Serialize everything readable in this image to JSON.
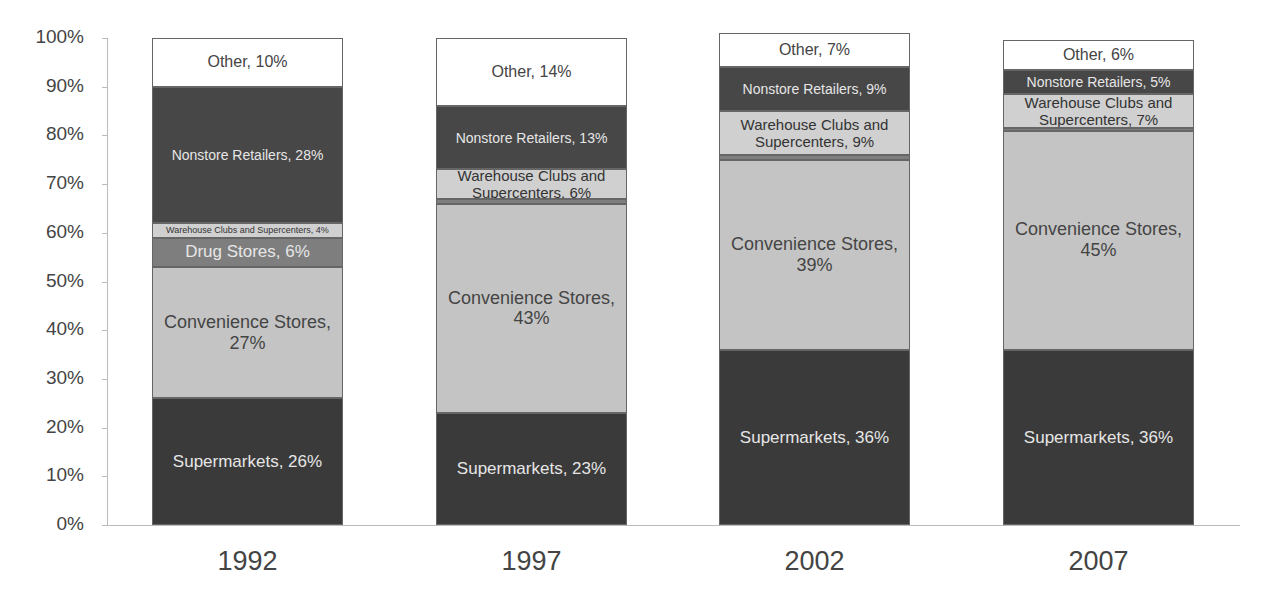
{
  "chart_data": {
    "type": "bar",
    "stacked": true,
    "percent_stacked": true,
    "title": "",
    "xlabel": "",
    "ylabel": "",
    "ylim": [
      0,
      100
    ],
    "yticks": [
      "0%",
      "10%",
      "20%",
      "30%",
      "40%",
      "50%",
      "60%",
      "70%",
      "80%",
      "90%",
      "100%"
    ],
    "categories": [
      "1992",
      "1997",
      "2002",
      "2007"
    ],
    "legend": null,
    "grid": false,
    "series": [
      {
        "name": "Supermarkets",
        "color": "#3a3a3a",
        "text_color": "#e6e6e6",
        "values": [
          26,
          23,
          36,
          36
        ],
        "labels": [
          "Supermarkets, 26%",
          "Supermarkets, 23%",
          "Supermarkets, 36%",
          "Supermarkets, 36%"
        ]
      },
      {
        "name": "Convenience Stores",
        "color": "#c4c4c4",
        "text_color": "#444444",
        "values": [
          27,
          43,
          39,
          45
        ],
        "labels": [
          "Convenience Stores,\n27%",
          "Convenience Stores,\n43%",
          "Convenience Stores,\n39%",
          "Convenience Stores,\n45%"
        ]
      },
      {
        "name": "Drug Stores",
        "color": "#7e7e7e",
        "text_color": "#e6e6e6",
        "values": [
          6,
          1,
          1,
          0.5
        ],
        "labels": [
          "Drug Stores, 6%",
          "",
          "",
          ""
        ]
      },
      {
        "name": "Warehouse Clubs and Supercenters",
        "color": "#d0d0d0",
        "text_color": "#333333",
        "values": [
          3,
          6,
          9,
          7
        ],
        "labels": [
          "Warehouse Clubs and Supercenters, 4%",
          "Warehouse Clubs and\nSupercenters, 6%",
          "Warehouse Clubs and\nSupercenters, 9%",
          "Warehouse Clubs and\nSupercenters, 7%"
        ]
      },
      {
        "name": "Nonstore Retailers",
        "color": "#474747",
        "text_color": "#e6e6e6",
        "values": [
          28,
          13,
          9,
          5
        ],
        "labels": [
          "Nonstore Retailers, 28%",
          "Nonstore Retailers, 13%",
          "Nonstore Retailers, 9%",
          "Nonstore Retailers, 5%"
        ]
      },
      {
        "name": "Other",
        "color": "#ffffff",
        "text_color": "#444444",
        "values": [
          10,
          14,
          7,
          6
        ],
        "labels": [
          "Other, 10%",
          "Other, 14%",
          "Other, 7%",
          "Other, 6%"
        ]
      }
    ]
  }
}
